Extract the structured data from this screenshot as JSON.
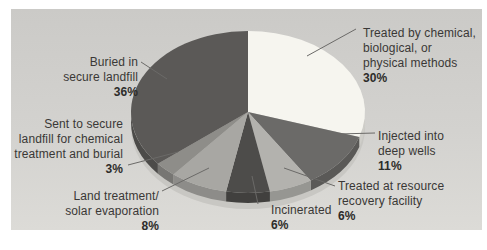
{
  "figure": {
    "background": "#ffffff",
    "panel": {
      "gradient_top": "#cbcac7",
      "gradient_bottom": "#dcdbd7"
    }
  },
  "chart_data": {
    "type": "pie",
    "style": "3d",
    "title": "",
    "unit": "percent",
    "start_angle_deg": 0,
    "direction": "clockwise",
    "base_color": "#c8c7c3",
    "leader_line_color": "#6b6a68",
    "slices": [
      {
        "label": "Treated by chemical, biological, or physical methods",
        "pct": 30,
        "color": "#f6f5ef"
      },
      {
        "label": "Injected into deep wells",
        "pct": 11,
        "color": "#6b6a68"
      },
      {
        "label": "Treated at resource recovery facility",
        "pct": 6,
        "color": "#b3b2ae"
      },
      {
        "label": "Incinerated",
        "pct": 6,
        "color": "#4d4c4a"
      },
      {
        "label": "Land treatment/solar evaporation",
        "pct": 8,
        "color": "#a8a7a3"
      },
      {
        "label": "Sent to secure landfill for chemical treatment and burial",
        "pct": 3,
        "color": "#8e8d89"
      },
      {
        "label": "Buried in secure landfill",
        "pct": 36,
        "color": "#5b5957"
      }
    ]
  },
  "labels": {
    "treated_by": {
      "lines": [
        "Treated by chemical,",
        "biological, or",
        "physical methods"
      ],
      "pct": "30%"
    },
    "injected": {
      "lines": [
        "Injected into",
        "deep wells"
      ],
      "pct": "11%"
    },
    "resource": {
      "lines": [
        "Treated at resource",
        "recovery facility"
      ],
      "pct": "6%"
    },
    "incinerated": {
      "lines": [
        "Incinerated"
      ],
      "pct": "6%"
    },
    "land": {
      "lines": [
        "Land treatment/",
        "solar evaporation"
      ],
      "pct": "8%"
    },
    "sent": {
      "lines": [
        "Sent to secure",
        "landfill for chemical",
        "treatment and burial"
      ],
      "pct": "3%"
    },
    "buried": {
      "lines": [
        "Buried in",
        "secure landfill"
      ],
      "pct": "36%"
    }
  }
}
